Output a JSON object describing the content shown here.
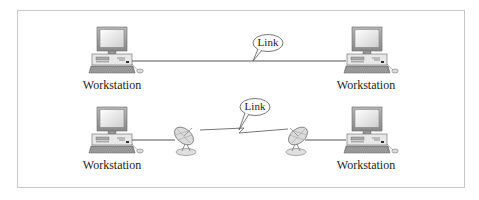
{
  "diagram": {
    "type": "network-link-comparison",
    "rows": [
      {
        "id": "wired",
        "left_node": {
          "label": "Workstation",
          "icon": "desktop-computer-icon"
        },
        "right_node": {
          "label": "Workstation",
          "icon": "desktop-computer-icon"
        },
        "link": {
          "label": "Link",
          "medium": "wired",
          "icon": "speech-bubble-callout"
        }
      },
      {
        "id": "wireless",
        "left_node": {
          "label": "Workstation",
          "icon": "desktop-computer-icon"
        },
        "right_node": {
          "label": "Workstation",
          "icon": "desktop-computer-icon"
        },
        "left_antenna": {
          "icon": "satellite-dish-icon"
        },
        "right_antenna": {
          "icon": "satellite-dish-icon"
        },
        "link": {
          "label": "Link",
          "medium": "wireless",
          "icon": "speech-bubble-callout"
        }
      }
    ],
    "colors": {
      "frame_border": "#c8c8c8",
      "line": "#555555",
      "monitor_screen": "#e6e6e6",
      "device_gray": "#9a9a9a",
      "text": "#222222"
    }
  }
}
